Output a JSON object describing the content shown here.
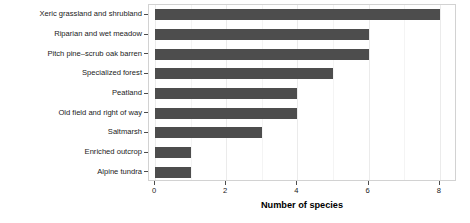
{
  "chart_data": {
    "type": "bar",
    "orientation": "horizontal",
    "title": "",
    "xlabel": "Number of species",
    "ylabel": "",
    "xlim": [
      0,
      8.6
    ],
    "xticks": [
      0,
      2,
      4,
      6,
      8
    ],
    "xticklabels": [
      "0",
      "2",
      "4",
      "6",
      "8"
    ],
    "grid": true,
    "legend": false,
    "bar_color": "#4d4d4d",
    "panel_border_color": "#d2d2d2",
    "gridline_color": "#ebebeb",
    "categories": [
      "Xeric grassland and shrubland",
      "Riparian and wet meadow",
      "Pitch pine–scrub oak barren",
      "Specialized forest",
      "Peatland",
      "Old field and right of way",
      "Saltmarsh",
      "Enriched outcrop",
      "Alpine tundra"
    ],
    "values": [
      8,
      6,
      6,
      5,
      4,
      4,
      3,
      1,
      1
    ]
  }
}
